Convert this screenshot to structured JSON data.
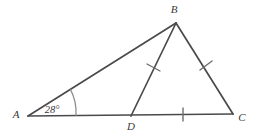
{
  "figure": {
    "type": "euclidean-geometry-diagram",
    "background_color": "#ffffff",
    "stroke_color": "#4a4a4d",
    "tick_color": "#6e6e72",
    "arc_color": "#8a8a8e",
    "label_color": "#3a3a3c",
    "stroke_width": 1.7
  },
  "vertices": [
    {
      "id": "A",
      "label": "A",
      "x": 28,
      "y": 116,
      "label_x": 16,
      "label_y": 118
    },
    {
      "id": "B",
      "label": "B",
      "x": 176,
      "y": 23,
      "label_x": 172,
      "label_y": 13
    },
    {
      "id": "C",
      "label": "C",
      "x": 233,
      "y": 114,
      "label_x": 240,
      "label_y": 121
    },
    {
      "id": "D",
      "label": "D",
      "x": 131,
      "y": 116,
      "label_x": 127,
      "label_y": 129
    }
  ],
  "segments": [
    {
      "id": "AB",
      "from": "A",
      "to": "B",
      "x1": 28,
      "y1": 116,
      "x2": 176,
      "y2": 23
    },
    {
      "id": "AC",
      "from": "A",
      "to": "C",
      "x1": 28,
      "y1": 116,
      "x2": 233,
      "y2": 114
    },
    {
      "id": "BC",
      "from": "B",
      "to": "C",
      "x1": 176,
      "y1": 23,
      "x2": 233,
      "y2": 114
    },
    {
      "id": "BD",
      "from": "B",
      "to": "D",
      "x1": 176,
      "y1": 23,
      "x2": 131,
      "y2": 116
    }
  ],
  "congruence_ticks": [
    {
      "id": "tick-BD",
      "on_segment": "BD",
      "count": 1,
      "x1": 147,
      "y1": 64,
      "x2": 160,
      "y2": 71
    },
    {
      "id": "tick-BC",
      "on_segment": "BC",
      "count": 1,
      "x1": 200,
      "y1": 70,
      "x2": 212,
      "y2": 61
    },
    {
      "id": "tick-DC",
      "on_segment": "DC",
      "count": 1,
      "x1": 183,
      "y1": 108,
      "x2": 183,
      "y2": 121
    }
  ],
  "angles": [
    {
      "id": "angle-A",
      "at_vertex": "A",
      "value": "28°",
      "measure_degrees": 28,
      "label_x": 52,
      "label_y": 112,
      "arc_radius": 48,
      "arc_start_x": 75.9,
      "arc_start_y": 115.8,
      "arc_end_x": 70.4,
      "arc_end_y": 89.4
    }
  ],
  "labels": {
    "vertex_a": "A",
    "vertex_b": "B",
    "vertex_c": "C",
    "vertex_d": "D",
    "angle_a_value": "28°"
  }
}
